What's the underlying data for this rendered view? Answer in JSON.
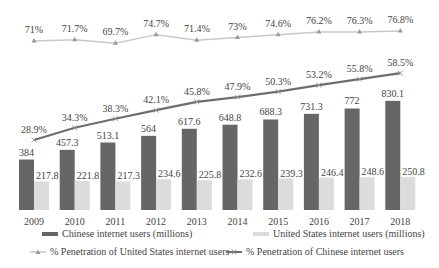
{
  "chart_data": {
    "type": "bar",
    "title": "",
    "xlabel": "",
    "ylabel": "",
    "categories": [
      "2009",
      "2010",
      "2011",
      "2012",
      "2013",
      "2014",
      "2015",
      "2016",
      "2017",
      "2018"
    ],
    "series": [
      {
        "name": "Chinese internet users (millions)",
        "kind": "bar",
        "color": "#666666",
        "values": [
          384,
          457.3,
          513.1,
          564,
          617.6,
          648.8,
          688.3,
          731.3,
          772,
          830.1
        ]
      },
      {
        "name": "United States internet users (millions)",
        "kind": "bar",
        "color": "#dcdcdc",
        "values": [
          217.8,
          221.8,
          217.3,
          234.6,
          225.8,
          232.6,
          239.3,
          246.4,
          248.6,
          250.8
        ]
      },
      {
        "name": "% Penetration of United States internet users",
        "kind": "line",
        "color": "#c8c8c8",
        "marker": "triangle",
        "values": [
          71,
          71.7,
          69.7,
          74.7,
          71.4,
          73,
          74.6,
          76.2,
          76.3,
          76.8
        ],
        "labels": [
          "71%",
          "71.7%",
          "69.7%",
          "74.7%",
          "71.4%",
          "73%",
          "74.6%",
          "76.2%",
          "76.3%",
          "76.8%"
        ]
      },
      {
        "name": "% Penetration of Chinese internet users",
        "kind": "line",
        "color": "#6e6e6e",
        "marker": "x",
        "values": [
          28.9,
          34.3,
          38.3,
          42.1,
          45.8,
          47.9,
          50.3,
          53.2,
          55.8,
          58.5
        ],
        "labels": [
          "28.9%",
          "34.3%",
          "38.3%",
          "42.1%",
          "45.8%",
          "47.9%",
          "50.3%",
          "53.2%",
          "55.8%",
          "58.5%"
        ]
      }
    ],
    "grid": false,
    "legend_position": "bottom"
  },
  "legend": {
    "items": [
      {
        "label": "Chinese internet users (millions)"
      },
      {
        "label": "United States internet users (millions)"
      },
      {
        "label": "% Penetration of United States internet users"
      },
      {
        "label": "% Penetration of Chinese internet users"
      }
    ]
  }
}
